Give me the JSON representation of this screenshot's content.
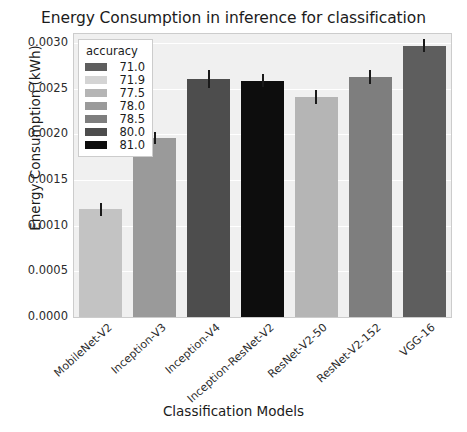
{
  "chart_data": {
    "type": "bar",
    "title": "Energy Consumption in inference for classification",
    "xlabel": "Classification Models",
    "ylabel": "Energy Consumption (kWh)",
    "categories": [
      "MobileNet-V2",
      "Inception-V3",
      "Inception-V4",
      "Inception-ResNet-V2",
      "ResNet-V2-50",
      "ResNet-V2-152",
      "VGG-16"
    ],
    "values": [
      0.00118,
      0.00196,
      0.00261,
      0.00259,
      0.00241,
      0.00263,
      0.00297
    ],
    "errors": [
      7e-05,
      7e-05,
      0.0001,
      7e-05,
      8e-05,
      8e-05,
      7e-05
    ],
    "bar_colors": [
      "#c3c3c3",
      "#9a9a9a",
      "#4d4d4d",
      "#0d0d0d",
      "#b5b5b5",
      "#7e7e7e",
      "#5e5e5e"
    ],
    "bar_accuracy": [
      71.9,
      78.0,
      80.0,
      81.0,
      77.5,
      78.5,
      71.0
    ],
    "ylim": [
      0.0,
      0.0031
    ],
    "yticks": [
      0.0,
      0.0005,
      0.001,
      0.0015,
      0.002,
      0.0025,
      0.003
    ],
    "ytick_labels": [
      "0.0000",
      "0.0005",
      "0.0010",
      "0.0015",
      "0.0020",
      "0.0025",
      "0.0030"
    ],
    "grid": true,
    "legend_position": "upper left"
  },
  "legend": {
    "title": "accuracy",
    "entries": [
      {
        "label": "71.0",
        "color": "#5e5e5e"
      },
      {
        "label": "71.9",
        "color": "#d4d4d4"
      },
      {
        "label": "77.5",
        "color": "#b5b5b5"
      },
      {
        "label": "78.0",
        "color": "#9a9a9a"
      },
      {
        "label": "78.5",
        "color": "#7e7e7e"
      },
      {
        "label": "80.0",
        "color": "#4d4d4d"
      },
      {
        "label": "81.0",
        "color": "#0d0d0d"
      }
    ]
  }
}
